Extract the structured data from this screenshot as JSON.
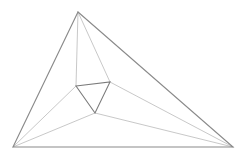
{
  "figure": {
    "canvas": {
      "width": 246,
      "height": 161,
      "background": "#ffffff"
    },
    "styles": {
      "outer_edge_color": "#8a8a8a",
      "outer_edge_width": 1.1,
      "inner_edge_color": "#7b7b7b",
      "inner_edge_width": 1.1,
      "connector_color": "#c2c2c2",
      "connector_width": 0.9
    },
    "points": {
      "outer_apex": {
        "name": "outer-apex",
        "x": 78,
        "y": 12
      },
      "outer_bottom_left": {
        "name": "outer-bottom-left",
        "x": 13,
        "y": 147
      },
      "outer_bottom_right": {
        "name": "outer-bottom-right",
        "x": 233,
        "y": 147
      },
      "inner_left": {
        "name": "inner-left",
        "x": 76,
        "y": 86
      },
      "inner_right": {
        "name": "inner-right",
        "x": 110,
        "y": 82
      },
      "inner_bottom": {
        "name": "inner-bottom",
        "x": 95,
        "y": 113
      }
    },
    "outer_triangle": {
      "label": "outer triangle",
      "polygon": "78,12 233,147 13,147"
    },
    "inner_triangle": {
      "label": "inner triangle",
      "polygon": "76,86 110,82 95,113"
    },
    "connectors": [
      {
        "name": "apex-to-inner-left",
        "from": "outer_apex",
        "to": "inner_left",
        "d": "M 78 12 L 76 86"
      },
      {
        "name": "apex-to-inner-right",
        "from": "outer_apex",
        "to": "inner_right",
        "d": "M 78 12 L 110 82"
      },
      {
        "name": "bottom-left-to-inner-left",
        "from": "outer_bottom_left",
        "to": "inner_left",
        "d": "M 13 147 L 76 86"
      },
      {
        "name": "bottom-left-to-inner-bottom",
        "from": "outer_bottom_left",
        "to": "inner_bottom",
        "d": "M 13 147 L 95 113"
      },
      {
        "name": "bottom-right-to-inner-right",
        "from": "outer_bottom_right",
        "to": "inner_right",
        "d": "M 233 147 L 110 82"
      },
      {
        "name": "bottom-right-to-inner-bottom",
        "from": "outer_bottom_right",
        "to": "inner_bottom",
        "d": "M 233 147 L 95 113"
      }
    ]
  }
}
